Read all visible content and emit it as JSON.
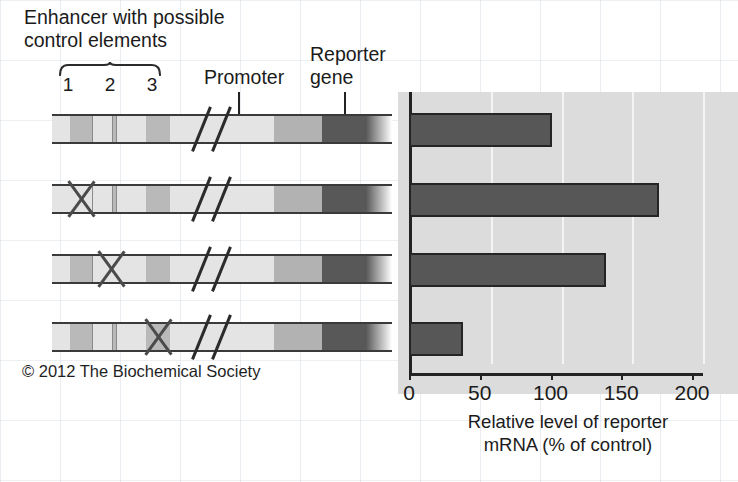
{
  "figure": {
    "copyright": "© 2012 The Biochemical Society",
    "enhancer_title": "Enhancer with possible\ncontrol elements",
    "promoter_label": "Promoter",
    "reporter_label": "Reporter\ngene",
    "element_numbers": [
      "1",
      "2",
      "3"
    ],
    "colors": {
      "bar_fill": "#575757",
      "bar_stroke": "#252525",
      "plot_background": "#dcdcdc",
      "gridline": "#f4f4f4",
      "axis": "#232323",
      "reporter_gene": "#585858",
      "promoter": "#b2b2b2",
      "control_element": "#b9b9b9",
      "spacer": "#e4e4e4"
    }
  },
  "constructs": [
    {
      "name": "intact-control",
      "deleted_element": null,
      "label": "All control elements intact"
    },
    {
      "name": "element-1-deleted",
      "deleted_element": "1",
      "label": "Control element 1 deleted"
    },
    {
      "name": "element-2-deleted",
      "deleted_element": "2",
      "label": "Control element 2 deleted"
    },
    {
      "name": "element-3-deleted",
      "deleted_element": "3",
      "label": "Control element 3 deleted"
    }
  ],
  "chart_data": {
    "type": "bar",
    "orientation": "horizontal",
    "title": "",
    "xlabel": "Relative level of reporter\nmRNA (% of control)",
    "ylabel": "",
    "xlim": [
      0,
      210
    ],
    "xticks": [
      0,
      50,
      100,
      150,
      200
    ],
    "xtick_labels": [
      "0",
      "50",
      "100",
      "150",
      "200"
    ],
    "grid": "vertical-only",
    "legend": "none",
    "categories": [
      "All control elements intact",
      "Control element 1 deleted",
      "Control element 2 deleted",
      "Control element 3 deleted"
    ],
    "values": [
      101,
      177,
      139,
      38
    ]
  }
}
